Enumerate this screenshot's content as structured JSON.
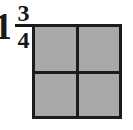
{
  "canvas": {
    "width": 133,
    "height": 130,
    "background_color": "#ffffff"
  },
  "mixed_number": {
    "whole": "1",
    "numerator": "3",
    "denominator": "4",
    "text_color": "#161616"
  },
  "diagram": {
    "shape": "square",
    "fill_color": "#a9a9a9",
    "line_color": "#1c1c1c",
    "rows": 2,
    "columns": 2,
    "total_parts": 4,
    "shaded_parts": 4,
    "quadrants": [
      {
        "name": "top-left",
        "shaded": true
      },
      {
        "name": "top-right",
        "shaded": true
      },
      {
        "name": "bottom-left",
        "shaded": true
      },
      {
        "name": "bottom-right",
        "shaded": true
      }
    ]
  }
}
